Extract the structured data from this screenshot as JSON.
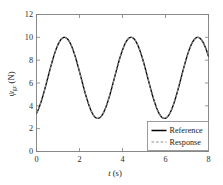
{
  "chart_data": {
    "type": "line",
    "title": "",
    "xlabel": "t (s)",
    "ylabel": "ψgc (N)",
    "ylabel_symbol": "ψ",
    "ylabel_subscript": "gc",
    "ylabel_units": "(N)",
    "xlim": [
      0,
      8
    ],
    "ylim": [
      0,
      12
    ],
    "xticks": [
      0,
      2,
      4,
      6,
      8
    ],
    "yticks": [
      0,
      2,
      4,
      6,
      8,
      10,
      12
    ],
    "xticklabels": [
      "0",
      "2",
      "4",
      "6",
      "8"
    ],
    "yticklabels": [
      "0",
      "2",
      "4",
      "6",
      "8",
      "10",
      "12"
    ],
    "grid": false,
    "legend_position": "lower right",
    "waveform": {
      "offset": 6.45,
      "amplitude": 3.55,
      "period": 3.1,
      "peak_value": 10.0,
      "trough_value": 2.9,
      "start_value": 3.8,
      "end_value": 8.3,
      "peak_times": [
        1.3,
        4.4,
        7.5
      ],
      "trough_times": [
        2.75,
        5.85
      ]
    },
    "series": [
      {
        "name": "Reference",
        "color": "#000000",
        "style": "solid"
      },
      {
        "name": "Response",
        "color": "#8c8c8c",
        "style": "dashed"
      }
    ]
  },
  "legend": {
    "items": [
      {
        "label": "Reference"
      },
      {
        "label": "Response"
      }
    ]
  },
  "axes": {
    "x_title": "t (s)",
    "x_symbol": "t",
    "x_units": "(s)",
    "y_symbol": "ψ",
    "y_subscript": "gc",
    "y_units": "(N)"
  }
}
